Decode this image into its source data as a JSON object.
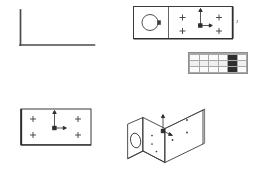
{
  "sheet": {
    "background_color": "#ffffff",
    "line_color": "#3b3b3b",
    "title": "CAD Drawing Sheet"
  },
  "views": {
    "profile_sketch": {
      "name": "L-profile sketch",
      "description": "Angle profile right-angle polyline",
      "stroke_color": "#4a4a4a"
    },
    "front_view": {
      "name": "Front orthographic view",
      "circle_label": "bore",
      "edge_label": "J",
      "hole_count": "4",
      "divider": "partition line"
    },
    "plan_view": {
      "name": "Plan orthographic view",
      "left_label": "L",
      "right_label": "J",
      "hole_count": "4"
    },
    "iso_view": {
      "name": "Isometric bracket view",
      "description": "L-bracket with bore and hole pattern"
    }
  },
  "hole_table": {
    "name": "hole-table",
    "columns": [
      "",
      "",
      "",
      "",
      "",
      ""
    ],
    "rows": [
      [
        "",
        "",
        "",
        "",
        "",
        ""
      ],
      [
        "",
        "",
        "",
        "",
        "",
        ""
      ],
      [
        "",
        "",
        "",
        "",
        "",
        ""
      ]
    ],
    "highlight_column_index": 4,
    "highlight_color": "#2e2e2e",
    "header_color": "#d8d8d8"
  },
  "axis_markers": {
    "front_view": "origin-axis",
    "plan_view": "origin-axis",
    "iso_view": "origin-axis"
  }
}
